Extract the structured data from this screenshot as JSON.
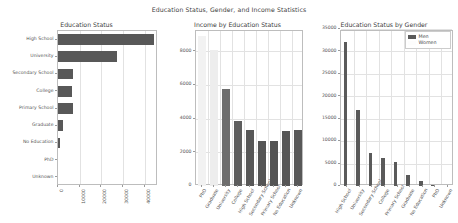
{
  "figure": {
    "suptitle": "Education Status, Gender, and Income Statistics",
    "background": "#ffffff",
    "grid_color": "#e2e2e2",
    "axes_color": "#bdbdbd"
  },
  "chart_data": [
    {
      "type": "bar",
      "orientation": "horizontal",
      "title": "Education Status",
      "xlabel": "",
      "ylabel": "",
      "categories": [
        "High School",
        "University",
        "Secondary School",
        "College",
        "Primary School",
        "Graduate",
        "No Education",
        "PhD",
        "Unknown"
      ],
      "values": [
        44000,
        27000,
        7000,
        6400,
        6700,
        2500,
        900,
        60,
        30
      ],
      "xlim": [
        0,
        46000
      ],
      "xticks": [
        0,
        10000,
        20000,
        30000,
        40000
      ],
      "xticklabels": [
        "0",
        "10000",
        "20000",
        "30000",
        "40000"
      ],
      "bar_color": "#585858",
      "grid": true,
      "legend": null
    },
    {
      "type": "bar",
      "orientation": "vertical",
      "title": "Income by Education Status",
      "xlabel": "",
      "ylabel": "",
      "categories": [
        "PhD",
        "Graduate",
        "University",
        "College",
        "High School",
        "Secondary School",
        "Primary School",
        "No Education",
        "Unknown"
      ],
      "values": [
        8900,
        8050,
        5750,
        3850,
        3350,
        2700,
        2680,
        3250,
        3350
      ],
      "bar_colors": [
        "#f2f2f2",
        "#ededed",
        "#6e6e6e",
        "#5d5d5d",
        "#575757",
        "#545454",
        "#545454",
        "#565656",
        "#585858"
      ],
      "ylim": [
        0,
        9200
      ],
      "yticks": [
        2000,
        4000,
        6000,
        8000
      ],
      "yticklabels": [
        "2000",
        "4000",
        "6000",
        "8000"
      ],
      "ytick_zero_label": "0",
      "grid": true,
      "legend": null
    },
    {
      "type": "bar",
      "orientation": "vertical",
      "title": "Education Status by Gender",
      "xlabel": "",
      "ylabel": "",
      "categories": [
        "High School",
        "University",
        "Secondary School",
        "College",
        "Primary School",
        "Graduate",
        "No Education",
        "PhD",
        "Unknown"
      ],
      "series": [
        {
          "name": "Men",
          "color": "#5a5a5a",
          "values": [
            32000,
            17000,
            7300,
            6200,
            5400,
            2400,
            1200,
            120,
            40
          ]
        },
        {
          "name": "Women",
          "color": "#fdfdfd",
          "values": [
            0,
            0,
            0,
            0,
            0,
            0,
            0,
            0,
            0
          ]
        }
      ],
      "ylim": [
        0,
        34500
      ],
      "yticks": [
        0,
        5000,
        10000,
        15000,
        20000,
        25000,
        30000,
        35000
      ],
      "yticklabels": [
        "0",
        "5000",
        "10000",
        "15000",
        "20000",
        "25000",
        "30000",
        "35000"
      ],
      "grid": true,
      "legend": {
        "position": "upper-right",
        "entries": [
          "Men",
          "Women"
        ]
      }
    }
  ]
}
